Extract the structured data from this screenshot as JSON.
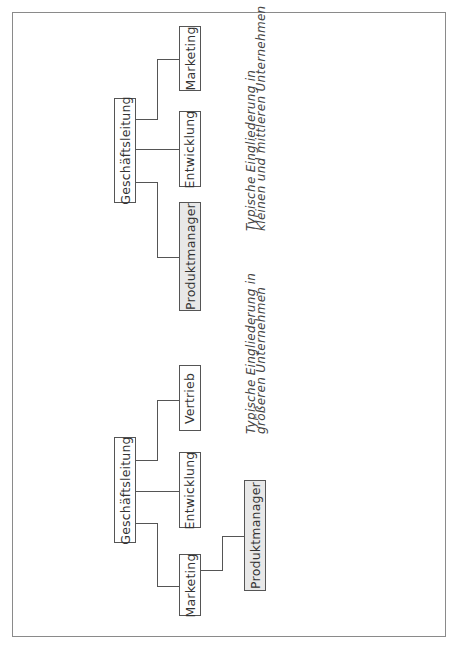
{
  "diagram_top": {
    "root": "Geschäftsleitung",
    "children": [
      "Produktmanager",
      "Entwicklung",
      "Marketing"
    ],
    "highlighted": "Produktmanager",
    "caption": [
      "Typische Eingliederung in",
      "kleinen und mittleren Unternehmen"
    ]
  },
  "diagram_bottom": {
    "root": "Geschäftsleitung",
    "children": [
      "Marketing",
      "Entwicklung",
      "Vertrieb"
    ],
    "sub_child_of_marketing": "Produktmanager",
    "highlighted": "Produktmanager",
    "caption": [
      "Typische Eingliederung in",
      "größeren Unternehmen"
    ]
  },
  "colors": {
    "highlight_fill": "#e8e8e8",
    "line": "#555555",
    "frame": "#8a8a8a"
  }
}
